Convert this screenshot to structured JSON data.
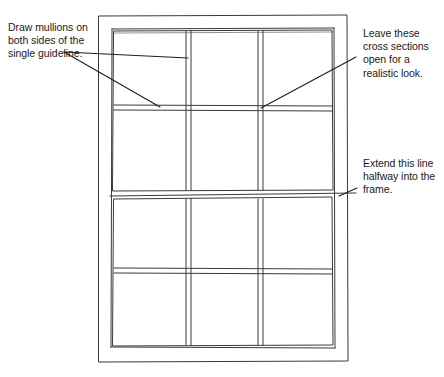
{
  "document": {
    "title": "Window drawing instructional diagram",
    "background_color": "#ffffff",
    "ink_color": "#333333",
    "text_color": "#1a1a1a"
  },
  "annotations": [
    {
      "id": "note-mullions",
      "text": "Draw mullions on both sides of the single guideline.",
      "position": "left-top",
      "leader_target": "upper-sash mullions"
    },
    {
      "id": "note-cross",
      "text": "Leave these cross sections open for a realistic look.",
      "position": "right-top",
      "leader_target": "mullion intersection"
    },
    {
      "id": "note-extend",
      "text": "Extend this line halfway into the frame.",
      "position": "right-middle",
      "leader_target": "meeting rail line"
    }
  ],
  "drawing": {
    "subject": "double-hung window",
    "outer_frame": {
      "x": 98,
      "y": 15,
      "width": 250,
      "height": 347
    },
    "inner_frame": {
      "x": 111,
      "y": 28,
      "width": 224,
      "height": 320
    },
    "sashes": [
      {
        "name": "upper-sash",
        "columns": 3,
        "rows": 2
      },
      {
        "name": "lower-sash",
        "columns": 3,
        "rows": 2
      }
    ],
    "meeting_rail_y": 195,
    "mullion_style": "double-line",
    "intersections": "open cross sections"
  }
}
